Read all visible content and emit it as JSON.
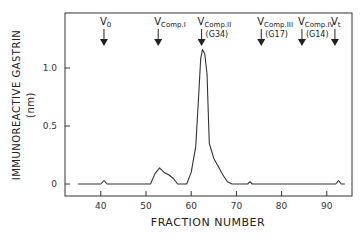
{
  "chart_data": {
    "type": "line",
    "title": "",
    "xlabel": "FRACTION NUMBER",
    "ylabel": "IMMUNOREACTIVE GASTRIN",
    "ylabel_unit": "(nm)",
    "xlim": [
      32,
      95
    ],
    "ylim": [
      -0.1,
      1.28
    ],
    "xticks": [
      40,
      50,
      60,
      70,
      80,
      90
    ],
    "yticks": [
      0,
      0.5,
      1.0
    ],
    "ytick_labels": [
      "0",
      "0.5",
      "1.0"
    ],
    "grid": false,
    "legend": null,
    "series": [
      {
        "name": "Immunoreactive gastrin",
        "x": [
          35,
          40,
          40.7,
          41.4,
          51,
          52,
          53,
          54,
          55,
          56,
          57,
          58,
          59,
          60,
          61,
          61.6,
          62.1,
          62.5,
          63,
          63.5,
          64,
          65,
          66,
          67,
          68,
          69,
          72.5,
          73,
          73.5,
          92,
          92.6,
          93.2,
          94
        ],
        "y": [
          0,
          0,
          0.03,
          0,
          0,
          0.09,
          0.14,
          0.1,
          0.08,
          0.05,
          0,
          0,
          0,
          0.1,
          0.32,
          0.72,
          1.08,
          1.16,
          1.12,
          0.95,
          0.35,
          0.22,
          0.15,
          0.08,
          0.02,
          0,
          0,
          0.02,
          0,
          0,
          0.03,
          0,
          0
        ]
      }
    ],
    "annotations": [
      {
        "label": "V",
        "subscript": "0",
        "extra": "",
        "fraction": 40.7
      },
      {
        "label": "V",
        "subscript": "Comp.I",
        "extra": "",
        "fraction": 52.7
      },
      {
        "label": "V",
        "subscript": "Comp.II",
        "extra": "(G34)",
        "fraction": 62.3
      },
      {
        "label": "V",
        "subscript": "Comp.III",
        "extra": "(G17)",
        "fraction": 75.5
      },
      {
        "label": "V",
        "subscript": "Comp.IV",
        "extra": "(G14)",
        "fraction": 84.5
      },
      {
        "label": "V",
        "subscript": "t",
        "extra": "",
        "fraction": 91.8
      }
    ]
  }
}
